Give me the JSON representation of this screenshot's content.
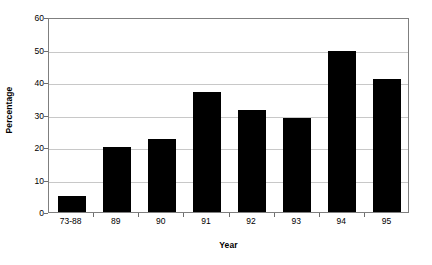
{
  "chart_data": {
    "type": "bar",
    "title": "",
    "subtitle": "",
    "xlabel": "Year",
    "ylabel": "Percentage",
    "categories": [
      "73-88",
      "89",
      "90",
      "91",
      "92",
      "93",
      "94",
      "95"
    ],
    "values": [
      5,
      20,
      22.5,
      37,
      31.5,
      29,
      49.5,
      41
    ],
    "series": [
      {
        "name": "Percentage",
        "values": [
          5,
          20,
          22.5,
          37,
          31.5,
          29,
          49.5,
          41
        ]
      }
    ],
    "ylim": [
      0,
      60
    ],
    "yticks": [
      0,
      10,
      20,
      30,
      40,
      50,
      60
    ],
    "ytick_labels": [
      "0",
      "10",
      "20",
      "30",
      "40",
      "50",
      "60"
    ],
    "grid": true,
    "grid_axis": "y",
    "legend": false,
    "legend_position": "none",
    "bar_color": "#000000",
    "grid_color": "#c8c8c8",
    "frame_color": "#7f7f7f",
    "background_color": "#ffffff",
    "annotations": []
  }
}
